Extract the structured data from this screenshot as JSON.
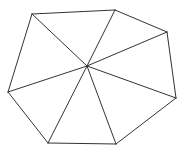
{
  "diagram": {
    "type": "triangulated-polygon",
    "stroke_color": "#333333",
    "background_color": "#ffffff",
    "vertex_count": 7,
    "triangle_count": 7,
    "labels": []
  }
}
